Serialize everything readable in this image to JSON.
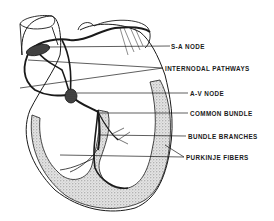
{
  "diagram": {
    "labels": [
      {
        "id": "sa-node",
        "text": "S-A NODE"
      },
      {
        "id": "internodal-pathways",
        "text": "INTERNODAL PATHWAYS"
      },
      {
        "id": "av-node",
        "text": "A-V NODE"
      },
      {
        "id": "common-bundle",
        "text": "COMMON BUNDLE"
      },
      {
        "id": "bundle-branches",
        "text": "BUNDLE BRANCHES"
      },
      {
        "id": "purkinje-fibers",
        "text": "PURKINJE FIBERS"
      }
    ],
    "colors": {
      "ink": "#1a1a1a",
      "stipple": "#9a9a9a",
      "background": "#ffffff"
    }
  }
}
